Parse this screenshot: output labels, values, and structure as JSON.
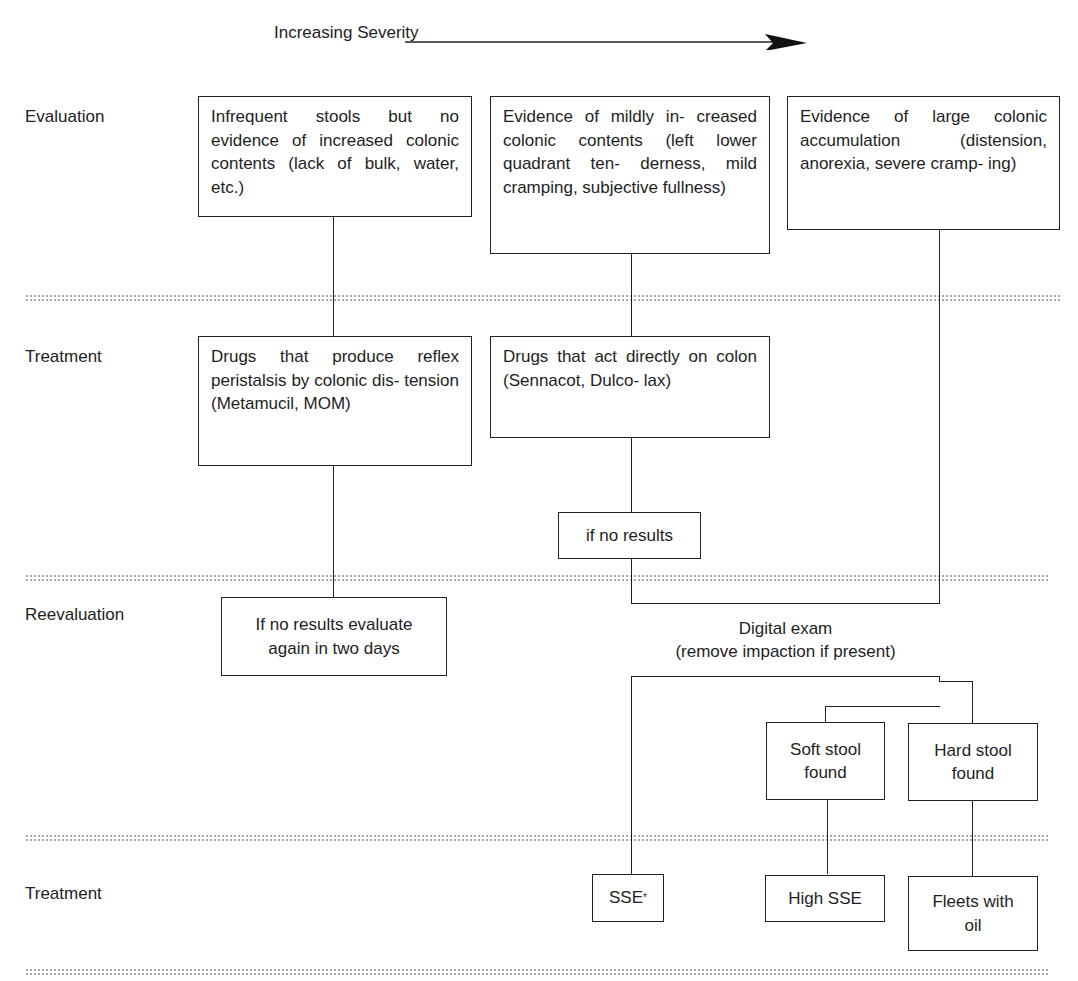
{
  "header": {
    "severity_label": "Increasing Severity",
    "arrow_icon": "right-arrow"
  },
  "rows": [
    {
      "label": "Evaluation"
    },
    {
      "label": "Treatment"
    },
    {
      "label": "Reevaluation"
    },
    {
      "label": "Treatment"
    }
  ],
  "evaluation": {
    "col1": "Infrequent stools but no evidence of increased colonic contents (lack of bulk, water, etc.)",
    "col2": "Evidence of mildly in- creased colonic contents (left lower quadrant ten- derness, mild cramping, subjective fullness)",
    "col3": "Evidence of large colonic accumulation (distension, anorexia, severe cramp- ing)"
  },
  "treatment": {
    "col1": "Drugs that produce reflex peristalsis by colonic dis- tension (Metamucil, MOM)",
    "col2": "Drugs that act directly on colon (Sennacot, Dulco- lax)",
    "if_no_results": "if no results"
  },
  "reevaluation": {
    "col1_line1": "If no results evaluate",
    "col1_line2": "again in two days",
    "digital_exam_line1": "Digital exam",
    "digital_exam_line2": "(remove impaction if present)",
    "soft_stool_line1": "Soft stool",
    "soft_stool_line2": "found",
    "hard_stool_line1": "Hard stool",
    "hard_stool_line2": "found"
  },
  "final_treatment": {
    "sse": "SSE",
    "sse_footnote_mark": "*",
    "high_sse": "High SSE",
    "fleets_line1": "Fleets with",
    "fleets_line2": "oil"
  },
  "colors": {
    "line": "#222222",
    "separator_dots": "#a9a9a9",
    "background": "#ffffff"
  }
}
